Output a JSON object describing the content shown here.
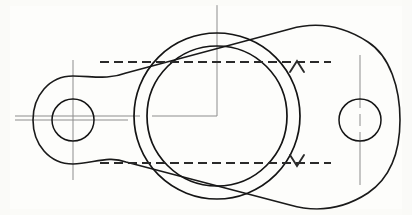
{
  "drawing": {
    "title": "Flange Gasket Plate — Plan View",
    "type": "engineering-orthographic-drawing",
    "canvas": {
      "width": 412,
      "height": 215,
      "background": "#fdfdfb"
    },
    "line_colors": {
      "object_line": "#1a1a1a",
      "center_line": "#8d8d8d",
      "section_line": "#2a2a2a"
    },
    "geometry": {
      "center": {
        "x": 217,
        "y": 116
      },
      "outer_body": {
        "name": "two-lobe-flange-outline",
        "left_extent_x": 33,
        "right_extent_x": 400,
        "top_extent_y": 25,
        "bottom_extent_y": 207
      },
      "central_bore_outer": {
        "cx": 217,
        "cy": 116,
        "r": 83
      },
      "central_bore_inner": {
        "cx": 217,
        "cy": 116,
        "r": 70
      },
      "left_bolt_hole": {
        "cx": 73,
        "cy": 120,
        "r": 21
      },
      "left_bolt_boss": {
        "cx": 73,
        "cy": 120,
        "r": 44
      },
      "right_bolt_hole": {
        "cx": 360,
        "cy": 120,
        "r": 21
      },
      "right_bolt_boss": {
        "cx": 360,
        "cy": 120,
        "r": 44
      }
    },
    "section_marks": [
      {
        "name": "upper-section-line",
        "y": 62,
        "x_start": 100,
        "x_end": 331,
        "arrow_x": 297,
        "arrow_direction": "up",
        "label": ""
      },
      {
        "name": "lower-section-line",
        "y": 163,
        "x_start": 100,
        "x_end": 331,
        "arrow_x": 297,
        "arrow_direction": "down",
        "label": ""
      }
    ],
    "center_lines": [
      {
        "name": "main-horizontal-centerline",
        "orientation": "horizontal",
        "y": 116,
        "x_start": 15,
        "x_end": 217
      },
      {
        "name": "main-vertical-centerline",
        "orientation": "vertical",
        "x": 217,
        "y_start": 5,
        "y_end": 116
      },
      {
        "name": "left-hole-vertical-centerline",
        "orientation": "vertical",
        "x": 73,
        "y_start": 60,
        "y_end": 180
      },
      {
        "name": "left-hole-horizontal-centerline",
        "orientation": "horizontal",
        "y": 120,
        "x_start": 15,
        "x_end": 128
      },
      {
        "name": "right-hole-vertical-centerline",
        "orientation": "vertical",
        "x": 360,
        "y_start": 55,
        "y_end": 185
      }
    ]
  }
}
